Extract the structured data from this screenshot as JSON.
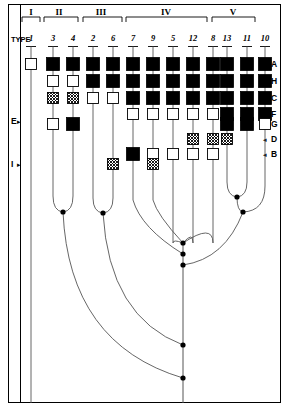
{
  "figure": {
    "title_text": "TYPE",
    "frame_color": "#000000",
    "cell_fill_solid": "#000000",
    "cell_fill_open": "#ffffff",
    "cell_fill_hatched": "#b5b5b5",
    "line_color": "#555555"
  },
  "groups": [
    {
      "label": "I",
      "x": 31,
      "x0": 22,
      "x1": 40
    },
    {
      "label": "II",
      "x": 59,
      "x1": 78,
      "x0": 44
    },
    {
      "label": "III",
      "x": 101,
      "x0": 83,
      "x1": 122
    },
    {
      "label": "IV",
      "x": 166,
      "x0": 126,
      "x1": 207
    },
    {
      "label": "V",
      "x": 233,
      "x0": 212,
      "x1": 255
    }
  ],
  "columns": [
    {
      "type": "1",
      "x": 31
    },
    {
      "type": "3",
      "x": 53
    },
    {
      "type": "4",
      "x": 73
    },
    {
      "type": "2",
      "x": 93
    },
    {
      "type": "6",
      "x": 113
    },
    {
      "type": "7",
      "x": 133
    },
    {
      "type": "9",
      "x": 153
    },
    {
      "type": "5",
      "x": 173
    },
    {
      "type": "12",
      "x": 193
    },
    {
      "type": "8",
      "x": 213
    },
    {
      "type": "13",
      "x": 227
    },
    {
      "type": "11",
      "x": 247
    },
    {
      "type": "10",
      "x": 265
    }
  ],
  "rows": [
    {
      "label": "A",
      "y": 64
    },
    {
      "label": "H",
      "y": 81
    },
    {
      "label": "C",
      "y": 98
    },
    {
      "label": "F",
      "y": 114
    },
    {
      "label": "G",
      "y": 124
    },
    {
      "label": "D",
      "y": 139
    },
    {
      "label": "B",
      "y": 154
    }
  ],
  "side_labels": [
    {
      "label": "E",
      "y": 121
    },
    {
      "label": "I",
      "y": 164
    }
  ],
  "chart_data": {
    "type": "table",
    "title": "",
    "row_labels": [
      "A",
      "H",
      "C",
      "F",
      "G",
      "D",
      "B"
    ],
    "column_labels": [
      "1",
      "3",
      "4",
      "2",
      "6",
      "7",
      "9",
      "5",
      "12",
      "8",
      "13",
      "11",
      "10"
    ],
    "group_labels": [
      "I",
      "II",
      "III",
      "IV",
      "V"
    ],
    "legend": {
      "solid": "filled square",
      "open": "open square",
      "hatched": "cross-hatched square"
    },
    "matrix": [
      {
        "row": "A",
        "cells": [
          "open",
          "solid",
          "solid",
          "solid",
          "solid",
          "solid",
          "solid",
          "solid",
          "solid",
          "solid",
          "solid",
          "solid",
          "solid"
        ]
      },
      {
        "row": "H",
        "cells": [
          "none",
          "open",
          "open",
          "solid",
          "solid",
          "solid",
          "solid",
          "solid",
          "solid",
          "solid",
          "solid",
          "solid",
          "solid"
        ]
      },
      {
        "row": "C",
        "cells": [
          "none",
          "hatched",
          "hatched",
          "open",
          "open",
          "solid",
          "solid",
          "solid",
          "solid",
          "solid",
          "solid",
          "solid",
          "solid"
        ]
      },
      {
        "row": "F",
        "cells": [
          "none",
          "none",
          "none",
          "none",
          "none",
          "open",
          "open",
          "open",
          "open",
          "open",
          "solid",
          "solid",
          "solid"
        ]
      },
      {
        "row": "G",
        "cells": [
          "none",
          "open",
          "solid",
          "none",
          "none",
          "none",
          "none",
          "none",
          "none",
          "none",
          "solid",
          "solid",
          "open"
        ]
      },
      {
        "row": "D",
        "cells": [
          "none",
          "none",
          "none",
          "none",
          "none",
          "none",
          "none",
          "none",
          "hatched",
          "hatched",
          "hatched",
          "none",
          "none"
        ]
      },
      {
        "row": "B",
        "cells": [
          "none",
          "none",
          "none",
          "none",
          "none",
          "solid",
          "open",
          "open",
          "open",
          "open",
          "none",
          "none",
          "none"
        ]
      },
      {
        "row": "I",
        "cells": [
          "none",
          "none",
          "none",
          "none",
          "hatched",
          "none",
          "hatched",
          "none",
          "none",
          "none",
          "none",
          "none",
          "none"
        ]
      }
    ]
  },
  "tree": {
    "nodes": [
      {
        "name": "node-3-4",
        "x": 63,
        "y": 212
      },
      {
        "name": "node-2-6",
        "x": 103,
        "y": 213
      },
      {
        "name": "node-13-11",
        "x": 237,
        "y": 197
      },
      {
        "name": "node-v",
        "x": 243,
        "y": 212
      },
      {
        "name": "node-iv-1",
        "x": 183,
        "y": 243
      },
      {
        "name": "node-iv-2",
        "x": 183,
        "y": 254
      },
      {
        "name": "node-iv-3",
        "x": 183,
        "y": 265
      },
      {
        "name": "node-root-1",
        "x": 183,
        "y": 345
      },
      {
        "name": "node-root-2",
        "x": 183,
        "y": 378
      }
    ]
  }
}
